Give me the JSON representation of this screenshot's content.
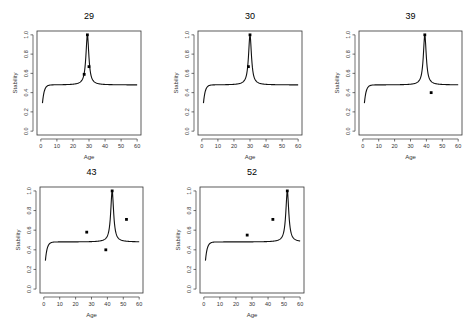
{
  "figure": {
    "panels_per_row": 3
  },
  "chart_data": [
    {
      "type": "line",
      "title": "29",
      "xlabel": "Age",
      "ylabel": "Stability",
      "xlim": [
        0,
        60
      ],
      "ylim": [
        0,
        1
      ],
      "xticks": [
        0,
        10,
        20,
        30,
        40,
        50,
        60
      ],
      "yticks": [
        "0.0",
        "0.2",
        "0.4",
        "0.6",
        "0.8",
        "1.0"
      ],
      "grid": false,
      "curve": {
        "baseline": 0.48,
        "start": 0.29,
        "peak_x": 29,
        "peak_y": 1.0
      },
      "points": [
        {
          "x": 27,
          "y": 0.59
        },
        {
          "x": 29,
          "y": 1.0
        },
        {
          "x": 30,
          "y": 0.67
        }
      ]
    },
    {
      "type": "line",
      "title": "30",
      "xlabel": "Age",
      "ylabel": "Stability",
      "xlim": [
        0,
        60
      ],
      "ylim": [
        0,
        1
      ],
      "xticks": [
        0,
        10,
        20,
        30,
        40,
        50,
        60
      ],
      "yticks": [
        "0.0",
        "0.2",
        "0.4",
        "0.6",
        "0.8",
        "1.0"
      ],
      "grid": false,
      "curve": {
        "baseline": 0.48,
        "start": 0.29,
        "peak_x": 30,
        "peak_y": 1.0
      },
      "points": [
        {
          "x": 29,
          "y": 0.67
        },
        {
          "x": 30,
          "y": 1.0
        }
      ]
    },
    {
      "type": "line",
      "title": "39",
      "xlabel": "Age",
      "ylabel": "Stability",
      "xlim": [
        0,
        60
      ],
      "ylim": [
        0,
        1
      ],
      "xticks": [
        0,
        10,
        20,
        30,
        40,
        50,
        60
      ],
      "yticks": [
        "0.0",
        "0.2",
        "0.4",
        "0.6",
        "0.8",
        "1.0"
      ],
      "grid": false,
      "curve": {
        "baseline": 0.48,
        "start": 0.29,
        "peak_x": 39,
        "peak_y": 1.0
      },
      "points": [
        {
          "x": 39,
          "y": 1.0
        },
        {
          "x": 43,
          "y": 0.4
        }
      ]
    },
    {
      "type": "line",
      "title": "43",
      "xlabel": "Age",
      "ylabel": "Stability",
      "xlim": [
        0,
        60
      ],
      "ylim": [
        0,
        1
      ],
      "xticks": [
        0,
        10,
        20,
        30,
        40,
        50,
        60
      ],
      "yticks": [
        "0.0",
        "0.2",
        "0.4",
        "0.6",
        "0.8",
        "1.0"
      ],
      "grid": false,
      "curve": {
        "baseline": 0.48,
        "start": 0.29,
        "peak_x": 43,
        "peak_y": 1.0
      },
      "points": [
        {
          "x": 27,
          "y": 0.58
        },
        {
          "x": 39,
          "y": 0.4
        },
        {
          "x": 43,
          "y": 1.0
        },
        {
          "x": 52,
          "y": 0.71
        }
      ]
    },
    {
      "type": "line",
      "title": "52",
      "xlabel": "Age",
      "ylabel": "Stability",
      "xlim": [
        0,
        60
      ],
      "ylim": [
        0,
        1
      ],
      "xticks": [
        0,
        10,
        20,
        30,
        40,
        50,
        60
      ],
      "yticks": [
        "0.0",
        "0.2",
        "0.4",
        "0.6",
        "0.8",
        "1.0"
      ],
      "grid": false,
      "curve": {
        "baseline": 0.48,
        "start": 0.29,
        "peak_x": 52,
        "peak_y": 1.0
      },
      "points": [
        {
          "x": 27,
          "y": 0.55
        },
        {
          "x": 43,
          "y": 0.71
        },
        {
          "x": 52,
          "y": 1.0
        }
      ]
    }
  ],
  "layout": {
    "boxes": [
      {
        "left": 37,
        "top": 31,
        "width": 104,
        "height": 104
      },
      {
        "left": 198,
        "top": 31,
        "width": 104,
        "height": 104
      },
      {
        "left": 359,
        "top": 31,
        "width": 103,
        "height": 104
      },
      {
        "left": 40,
        "top": 187,
        "width": 103,
        "height": 106
      },
      {
        "left": 200,
        "top": 187,
        "width": 104,
        "height": 106
      }
    ]
  }
}
